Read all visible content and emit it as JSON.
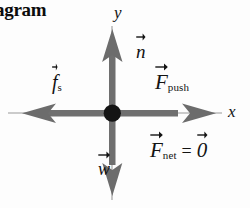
{
  "heading": {
    "text": "iagram",
    "note_clipped": true
  },
  "axes": {
    "y_label": "y",
    "x_label": "x",
    "origin_label": ""
  },
  "vectors": [
    {
      "id": "normal",
      "symbol": "n",
      "subscript": "",
      "direction": "up",
      "has_vector_arrow": true
    },
    {
      "id": "weight",
      "symbol": "w",
      "subscript": "",
      "direction": "down",
      "has_vector_arrow": true
    },
    {
      "id": "static-friction",
      "symbol": "f",
      "subscript": "s",
      "direction": "left",
      "has_vector_arrow": true
    },
    {
      "id": "push",
      "symbol": "F",
      "subscript": "push",
      "direction": "right",
      "has_vector_arrow": true
    }
  ],
  "equation": {
    "lhs_symbol": "F",
    "lhs_subscript": "net",
    "operator": "=",
    "rhs_symbol": "0",
    "lhs_has_vector_arrow": true,
    "rhs_has_vector_arrow": true,
    "full_text": "F_net = 0"
  },
  "colors": {
    "background": "#fdfdfd",
    "arrow_gray": "#6f6f6f",
    "arrow_gray_dark": "#5e5e5e",
    "axis_gray": "#7a7a7a",
    "dot_black": "#141414",
    "text_black": "#131313"
  },
  "geometry": {
    "origin_x": 112,
    "origin_y": 113,
    "up_arrow_tip_y": 30,
    "down_arrow_tip_y": 196,
    "left_arrow_tip_x": 22,
    "right_arrow_tip_x": 216,
    "axis_left_x": 8,
    "axis_right_x": 222,
    "axis_top_y": 26,
    "axis_bottom_y": 200
  }
}
